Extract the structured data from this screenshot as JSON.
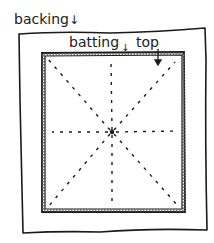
{
  "diagram": {
    "labels": {
      "backing": "backing",
      "batting": "batting",
      "top": "top"
    },
    "arrow_glyph": "↓",
    "layers": [
      {
        "name": "backing",
        "shape": "rectangle",
        "bbox": [
          18,
          32,
          205,
          232
        ]
      },
      {
        "name": "batting",
        "shape": "rectangle",
        "bbox": [
          42,
          52,
          185,
          212
        ]
      },
      {
        "name": "top",
        "shape": "rectangle",
        "bbox": [
          45,
          55,
          182,
          209
        ]
      }
    ],
    "basting_lines": {
      "center": [
        112,
        132
      ],
      "count": 8,
      "style": "dashed",
      "directions": [
        "N",
        "NE",
        "E",
        "SE",
        "S",
        "SW",
        "W",
        "NW"
      ]
    },
    "colors": {
      "ink": "#1a1a1a",
      "background": "#ffffff",
      "hatch": "#888888"
    }
  }
}
